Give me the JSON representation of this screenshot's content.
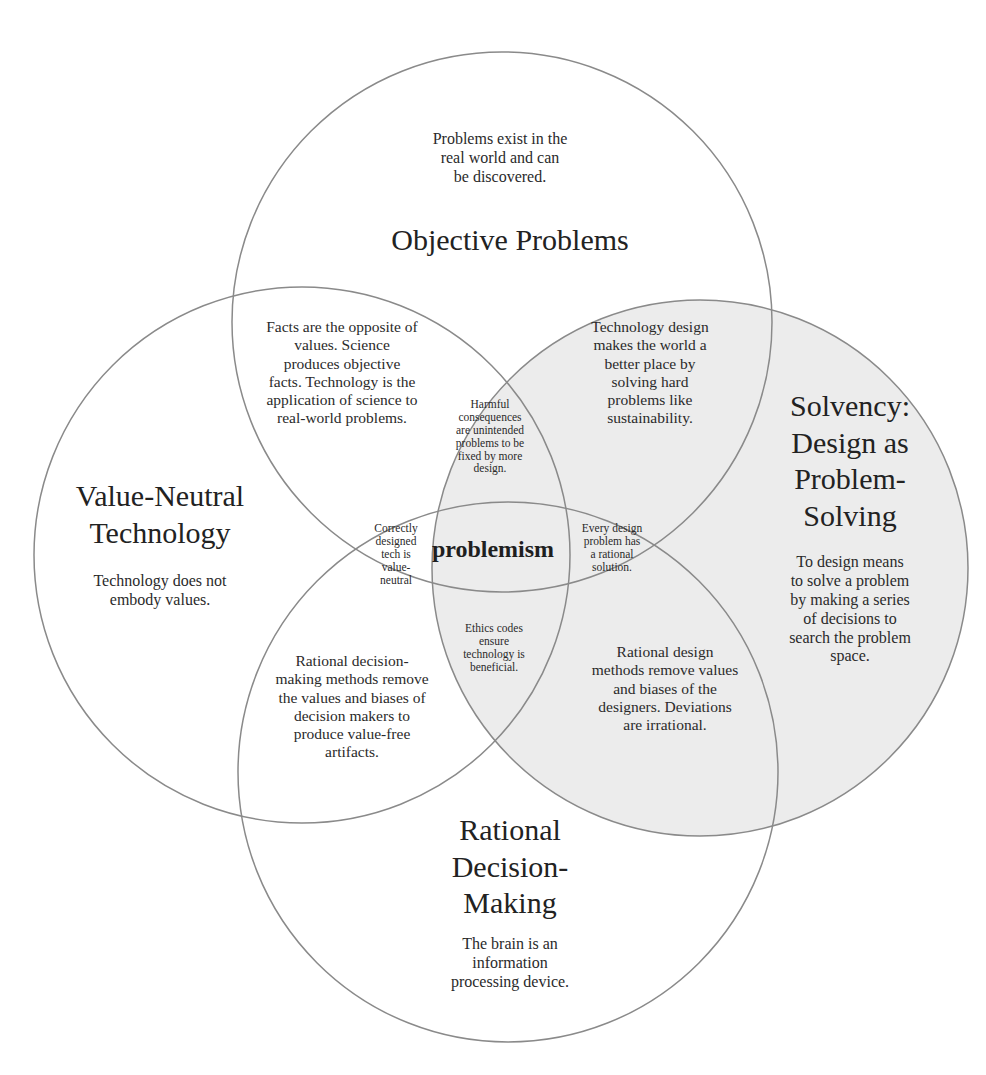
{
  "diagram": {
    "type": "venn",
    "center_label": "problemism",
    "colors": {
      "stroke": "#8a8a8a",
      "solvency_fill": "#ececec",
      "background": "#ffffff",
      "text": "#2a2a2a"
    },
    "sets": {
      "objective_problems": {
        "title": "Objective Problems",
        "description": "Problems exist in the\nreal world and can\nbe discovered."
      },
      "value_neutral_technology": {
        "title": "Value-Neutral\nTechnology",
        "description": "Technology does not\nembody values."
      },
      "solvency": {
        "title": "Solvency:\nDesign as\nProblem-\nSolving",
        "description": "To design means\nto solve a problem\nby making a series\nof decisions to\nsearch the problem\nspace."
      },
      "rational_decision_making": {
        "title": "Rational\nDecision-\nMaking",
        "description": "The brain is an\ninformation\nprocessing device."
      }
    },
    "intersections": {
      "objective_valueneutral": "Facts are the opposite of\nvalues. Science\nproduces objective\nfacts. Technology is the\napplication of science to\nreal-world problems.",
      "objective_solvency": "Technology design\nmakes the world a\nbetter place by\nsolving hard\nproblems like\nsustainability.",
      "objective_solvency_valueneutral": "Harmful\nconsequences\nare unintended\nproblems to be\nfixed by more\ndesign.",
      "valueneutral_rational_objective": "Correctly\ndesigned\ntech is\nvalue-\nneutral",
      "objective_solvency_rational": "Every design\nproblem has\na rational\nsolution.",
      "valueneutral_solvency_rational": "Ethics codes\nensure\ntechnology is\nbeneficial.",
      "valueneutral_rational": "Rational decision-\nmaking methods remove\nthe values and biases of\ndecision makers to\nproduce value-free\nartifacts.",
      "solvency_rational": "Rational design\nmethods remove values\nand biases of the\ndesigners. Deviations\nare irrational."
    }
  }
}
